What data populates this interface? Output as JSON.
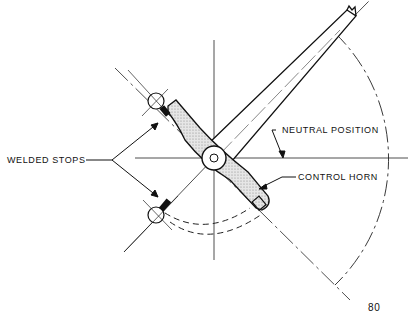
{
  "diagram": {
    "labels": {
      "welded_stops": "WELDED STOPS",
      "neutral_position": "NEUTRAL POSITION",
      "control_horn": "CONTROL HORN",
      "page_number": "80"
    },
    "colors": {
      "line": "#111111",
      "stipple": "#d4d4d4",
      "background": "#ffffff"
    }
  }
}
